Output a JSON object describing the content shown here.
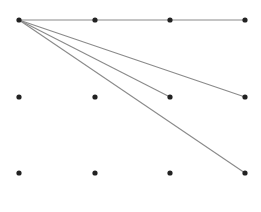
{
  "diagram": {
    "type": "dot-grid-lines",
    "grid": {
      "columns": 4,
      "rows": 3
    },
    "colors": {
      "dot": "#222222",
      "line": "#8a8a8a",
      "background": "#ffffff"
    },
    "dot_radius": 2.6,
    "nodes": [
      {
        "id": "r0c0",
        "x": 19,
        "y": 20
      },
      {
        "id": "r0c1",
        "x": 95,
        "y": 20
      },
      {
        "id": "r0c2",
        "x": 170,
        "y": 20
      },
      {
        "id": "r0c3",
        "x": 245,
        "y": 20
      },
      {
        "id": "r1c0",
        "x": 19,
        "y": 97
      },
      {
        "id": "r1c1",
        "x": 95,
        "y": 97
      },
      {
        "id": "r1c2",
        "x": 170,
        "y": 97
      },
      {
        "id": "r1c3",
        "x": 245,
        "y": 97
      },
      {
        "id": "r2c0",
        "x": 19,
        "y": 173
      },
      {
        "id": "r2c1",
        "x": 95,
        "y": 173
      },
      {
        "id": "r2c2",
        "x": 170,
        "y": 173
      },
      {
        "id": "r2c3",
        "x": 245,
        "y": 173
      }
    ],
    "edges": [
      {
        "from": "r0c0",
        "to": "r0c3"
      },
      {
        "from": "r0c0",
        "to": "r1c2"
      },
      {
        "from": "r0c0",
        "to": "r1c3"
      },
      {
        "from": "r0c0",
        "to": "r2c3"
      }
    ]
  }
}
